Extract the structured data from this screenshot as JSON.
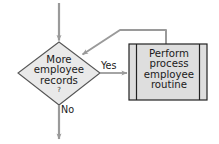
{
  "diagram": {
    "type": "flowchart",
    "nodes": [
      {
        "id": "decision",
        "shape": "diamond",
        "name": "decision-more-employee-records",
        "text": "More\nemployee\nrecords",
        "suffix": "?",
        "fill": "#e9e9e9",
        "stroke": "#555555"
      },
      {
        "id": "process",
        "shape": "predefined-process",
        "name": "predefined-process-perform-routine",
        "text": "Perform\nprocess\nemployee\nroutine",
        "fill": "#dedede",
        "stroke": "#222222"
      }
    ],
    "edges": [
      {
        "id": "entry",
        "name": "entry-arrow",
        "label": "",
        "from": "top",
        "to": "decision"
      },
      {
        "id": "yes",
        "name": "yes-branch-arrow",
        "label": "Yes",
        "from": "decision",
        "to": "process"
      },
      {
        "id": "no",
        "name": "no-branch-arrow",
        "label": "No",
        "from": "decision",
        "to": "bottom"
      },
      {
        "id": "loopback",
        "name": "loopback-arrow",
        "label": "",
        "from": "process",
        "to": "decision"
      }
    ],
    "colors": {
      "connector": "#9a9a9a",
      "decision_fill": "#e9e9e9",
      "decision_stroke": "#555555",
      "process_fill": "#dedede",
      "process_stroke": "#222222",
      "text": "#1a1a1a",
      "background": "#ffffff"
    }
  }
}
